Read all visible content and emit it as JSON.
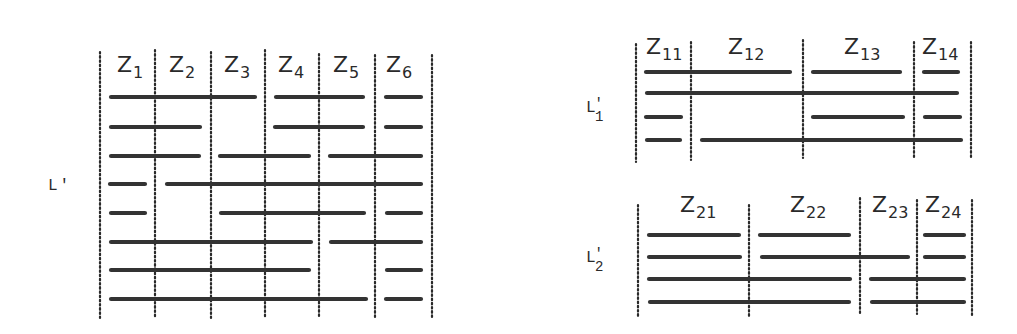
{
  "panels": [
    {
      "id": "L-prime",
      "label": {
        "main": "L",
        "prime": "'",
        "sub": "",
        "x": 48,
        "y": 190
      },
      "zones": [
        {
          "name": "Z",
          "sub": "1",
          "x": 117,
          "y": 72
        },
        {
          "name": "Z",
          "sub": "2",
          "x": 169,
          "y": 72
        },
        {
          "name": "Z",
          "sub": "3",
          "x": 224,
          "y": 72
        },
        {
          "name": "Z",
          "sub": "4",
          "x": 278,
          "y": 72
        },
        {
          "name": "Z",
          "sub": "5",
          "x": 333,
          "y": 72
        },
        {
          "name": "Z",
          "sub": "6",
          "x": 386,
          "y": 72
        }
      ],
      "dividers": [
        {
          "x": 100,
          "y1": 52,
          "y2": 318
        },
        {
          "x": 155,
          "y1": 50,
          "y2": 318
        },
        {
          "x": 211,
          "y1": 52,
          "y2": 318
        },
        {
          "x": 265,
          "y1": 50,
          "y2": 318
        },
        {
          "x": 319,
          "y1": 54,
          "y2": 318
        },
        {
          "x": 375,
          "y1": 55,
          "y2": 318
        },
        {
          "x": 432,
          "y1": 55,
          "y2": 318
        }
      ],
      "rows": [
        {
          "y": 97,
          "segments": [
            [
              111,
              255
            ],
            [
              276,
              363
            ],
            [
              386,
              421
            ]
          ]
        },
        {
          "y": 127,
          "segments": [
            [
              111,
              200
            ],
            [
              275,
              363
            ],
            [
              386,
              421
            ]
          ]
        },
        {
          "y": 156,
          "segments": [
            [
              111,
              199
            ],
            [
              220,
              309
            ],
            [
              330,
              421
            ]
          ]
        },
        {
          "y": 184,
          "segments": [
            [
              110,
              145
            ],
            [
              167,
              421
            ]
          ]
        },
        {
          "y": 213,
          "segments": [
            [
              111,
              145
            ],
            [
              221,
              364
            ],
            [
              387,
              421
            ]
          ]
        },
        {
          "y": 242,
          "segments": [
            [
              111,
              311
            ],
            [
              331,
              421
            ]
          ]
        },
        {
          "y": 270,
          "segments": [
            [
              111,
              309
            ],
            [
              387,
              421
            ]
          ]
        },
        {
          "y": 299,
          "segments": [
            [
              111,
              366
            ],
            [
              386,
              421
            ]
          ]
        }
      ]
    },
    {
      "id": "L1-prime",
      "label": {
        "main": "L",
        "prime": "'",
        "sub": "1",
        "x": 586,
        "y": 112
      },
      "zones": [
        {
          "name": "Z",
          "sub": "11",
          "x": 646,
          "y": 54
        },
        {
          "name": "Z",
          "sub": "12",
          "x": 728,
          "y": 54
        },
        {
          "name": "Z",
          "sub": "13",
          "x": 844,
          "y": 54
        },
        {
          "name": "Z",
          "sub": "14",
          "x": 922,
          "y": 54
        }
      ],
      "dividers": [
        {
          "x": 636,
          "y1": 44,
          "y2": 162
        },
        {
          "x": 691,
          "y1": 42,
          "y2": 160
        },
        {
          "x": 803,
          "y1": 40,
          "y2": 158
        },
        {
          "x": 914,
          "y1": 42,
          "y2": 158
        },
        {
          "x": 971,
          "y1": 42,
          "y2": 158
        }
      ],
      "rows": [
        {
          "y": 72,
          "segments": [
            [
              646,
              790
            ],
            [
              813,
              900
            ],
            [
              924,
              958
            ]
          ]
        },
        {
          "y": 93,
          "segments": [
            [
              647,
              957
            ]
          ]
        },
        {
          "y": 117,
          "segments": [
            [
              646,
              681
            ],
            [
              813,
              903
            ],
            [
              925,
              960
            ]
          ]
        },
        {
          "y": 140,
          "segments": [
            [
              647,
              680
            ],
            [
              702,
              961
            ]
          ]
        }
      ]
    },
    {
      "id": "L2-prime",
      "label": {
        "main": "L",
        "prime": "'",
        "sub": "2",
        "x": 586,
        "y": 262
      },
      "zones": [
        {
          "name": "Z",
          "sub": "21",
          "x": 680,
          "y": 212
        },
        {
          "name": "Z",
          "sub": "22",
          "x": 790,
          "y": 212
        },
        {
          "name": "Z",
          "sub": "23",
          "x": 872,
          "y": 212
        },
        {
          "name": "Z",
          "sub": "24",
          "x": 925,
          "y": 212
        }
      ],
      "dividers": [
        {
          "x": 638,
          "y1": 205,
          "y2": 316
        },
        {
          "x": 749,
          "y1": 205,
          "y2": 316
        },
        {
          "x": 860,
          "y1": 198,
          "y2": 314
        },
        {
          "x": 917,
          "y1": 200,
          "y2": 314
        },
        {
          "x": 972,
          "y1": 200,
          "y2": 316
        }
      ],
      "rows": [
        {
          "y": 235,
          "segments": [
            [
              649,
              739
            ],
            [
              760,
              849
            ],
            [
              925,
              964
            ]
          ]
        },
        {
          "y": 257,
          "segments": [
            [
              649,
              740
            ],
            [
              762,
              908
            ],
            [
              925,
              964
            ]
          ]
        },
        {
          "y": 279,
          "segments": [
            [
              649,
              850
            ],
            [
              871,
              964
            ]
          ]
        },
        {
          "y": 302,
          "segments": [
            [
              650,
              849
            ],
            [
              872,
              964
            ]
          ]
        }
      ]
    }
  ]
}
